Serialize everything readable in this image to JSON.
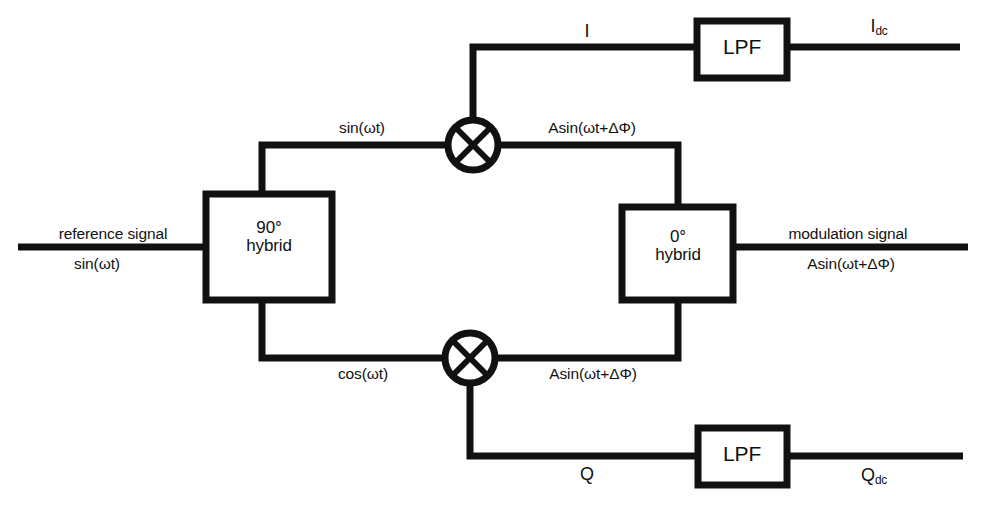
{
  "diagram": {
    "type": "block-diagram",
    "stroke_color": "#111111",
    "background_color": "#ffffff",
    "blocks": {
      "hybrid_90": {
        "line1": "90°",
        "line2": "hybrid"
      },
      "hybrid_0": {
        "line1": "0°",
        "line2": "hybrid"
      },
      "lpf_top": {
        "label": "LPF"
      },
      "lpf_bottom": {
        "label": "LPF"
      },
      "mixer_top": {
        "symbol": "✕"
      },
      "mixer_bottom": {
        "symbol": "✕"
      }
    },
    "signals": {
      "reference_name": "reference signal",
      "reference_expr": "sin(ωt)",
      "upper_branch": "sin(ωt)",
      "lower_branch": "cos(ωt)",
      "mixer_top_out": "Asin(ωt+ΔΦ)",
      "mixer_bottom_out": "Asin(ωt+ΔΦ)",
      "i_branch": "I",
      "q_branch": "Q",
      "modulation_name": "modulation signal",
      "modulation_expr": "Asin(ωt+ΔΦ)"
    },
    "outputs": {
      "i_dc_base": "I",
      "i_dc_sub": "dc",
      "q_dc_base": "Q",
      "q_dc_sub": "dc"
    }
  }
}
